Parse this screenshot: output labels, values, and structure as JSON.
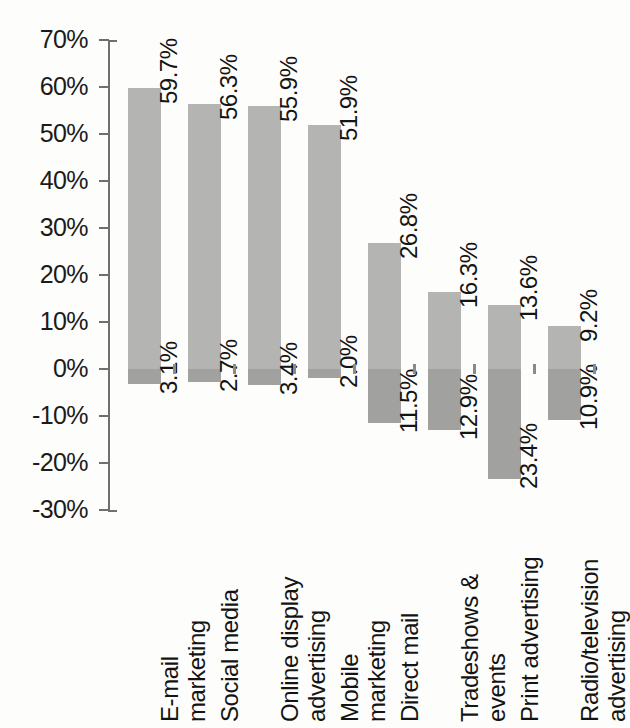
{
  "chart_data": {
    "type": "bar",
    "title": "",
    "subtitle": "",
    "xlabel": "",
    "ylabel": "",
    "ylim": [
      -30,
      70
    ],
    "grid": false,
    "legend": "none",
    "orientation": "vertical",
    "stacked_diverging": true,
    "axis_tick_labels": [
      "70%",
      "60%",
      "50%",
      "40%",
      "30%",
      "20%",
      "10%",
      "0%",
      "-10%",
      "-20%",
      "-30%"
    ],
    "axis_tick_values": [
      70,
      60,
      50,
      40,
      30,
      20,
      10,
      0,
      -10,
      -20,
      -30
    ],
    "categories": [
      "E-mail marketing",
      "Social media",
      "Online display advertising",
      "Mobile marketing",
      "Direct mail",
      "Tradeshows & events",
      "Print advertising",
      "Radio/television advertising"
    ],
    "category_lines": [
      [
        "E-mail",
        "marketing"
      ],
      [
        "Social media",
        ""
      ],
      [
        "Online display",
        "advertising"
      ],
      [
        "Mobile",
        "marketing"
      ],
      [
        "Direct mail",
        ""
      ],
      [
        "Tradeshows &",
        "events"
      ],
      [
        "Print advertising",
        ""
      ],
      [
        "Radio/television",
        "advertising"
      ]
    ],
    "series": [
      {
        "name": "Increase",
        "color": "#b4b4b3",
        "values": [
          59.7,
          56.3,
          55.9,
          51.9,
          26.8,
          16.3,
          13.6,
          9.2
        ],
        "labels": [
          "59.7%",
          "56.3%",
          "55.9%",
          "51.9%",
          "26.8%",
          "16.3%",
          "13.6%",
          "9.2%"
        ]
      },
      {
        "name": "Decrease",
        "color": "#a1a1a0",
        "values": [
          -3.1,
          -2.7,
          -3.4,
          -2.0,
          -11.5,
          -12.9,
          -23.4,
          -10.9
        ],
        "labels": [
          "3.1%",
          "2.7%",
          "3.4%",
          "2.0%",
          "11.5%",
          "12.9%",
          "23.4%",
          "10.9%"
        ]
      }
    ]
  },
  "colors": {
    "positive_bar": "#b4b4b3",
    "negative_bar": "#a1a1a0",
    "axis": "#6f6f6f",
    "text": "#141414",
    "background": "#fdfdfc"
  }
}
